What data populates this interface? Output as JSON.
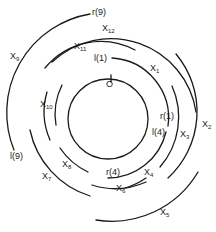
{
  "diagram": {
    "title": "",
    "center_label": "O",
    "labels": {
      "r9": "r(9)",
      "x12": "X",
      "x12_sub": "12",
      "x11": "X",
      "x11_sub": "11",
      "l1": "l(1)",
      "x1": "X",
      "x1_sub": "1",
      "x9": "X",
      "x9_sub": "9",
      "x10": "X",
      "x10_sub": "10",
      "r1": "r(1)",
      "l4": "l(4)",
      "x3": "X",
      "x3_sub": "3",
      "x2": "X",
      "x2_sub": "2",
      "l9": "l(9)",
      "x8": "X",
      "x8_sub": "8",
      "r4": "r(4)",
      "x4": "X",
      "x4_sub": "4",
      "x7": "X",
      "x7_sub": "7",
      "x6": "X",
      "x6_sub": "6",
      "x5": "X",
      "x5_sub": "5"
    },
    "colors": {
      "stroke": "#1a1a1a",
      "background": "#ffffff"
    }
  }
}
